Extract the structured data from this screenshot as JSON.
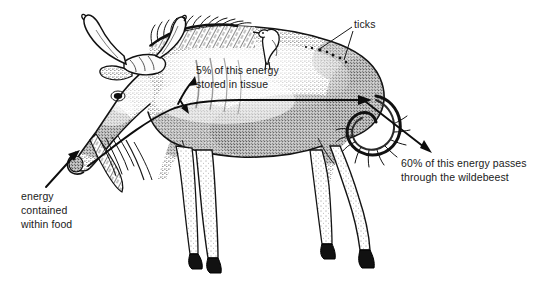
{
  "figure": {
    "subject": "wildebeest",
    "style": "stipple-ink-illustration",
    "background_color": "#ffffff",
    "ink_color": "#1a1a1a"
  },
  "annotations": {
    "energy_stored": {
      "id": "energy-stored-in-tissue",
      "lines": [
        "5% of this energy",
        "stored in tissue"
      ],
      "value": "5%"
    },
    "ticks": {
      "id": "ticks",
      "lines": [
        "ticks"
      ]
    },
    "energy_passes": {
      "id": "energy-passes-through",
      "lines": [
        "60% of this energy passes",
        "through the wildebeest"
      ],
      "value": "60%"
    },
    "energy_food": {
      "id": "energy-contained-within-food",
      "lines": [
        "energy",
        "contained",
        "within food"
      ]
    }
  },
  "arrows": [
    {
      "name": "food-intake-arrow",
      "from": "lower-left",
      "to": "mouth",
      "description": "points up-right into the wildebeest's mouth"
    },
    {
      "name": "energy-flow-arrow",
      "from": "mouth",
      "to": "rump",
      "description": "curves from mouth along body to hindquarters"
    },
    {
      "name": "tissue-storage-branch-arrow",
      "from": "neck",
      "to": "upper-body",
      "description": "short branch pointing up into the body tissue"
    },
    {
      "name": "energy-exit-arrow",
      "from": "tail",
      "to": "lower-right",
      "description": "passes through the curled tail pointing down-right"
    }
  ],
  "leader_lines": [
    {
      "name": "ticks-leader-upper",
      "from_label": "ticks",
      "to_feature": "rump-upper"
    },
    {
      "name": "ticks-leader-lower",
      "from_label": "ticks",
      "to_feature": "rump-lower"
    }
  ],
  "features": [
    {
      "name": "horns"
    },
    {
      "name": "mane"
    },
    {
      "name": "beard"
    },
    {
      "name": "oxpecker-bird"
    },
    {
      "name": "curled-tail"
    },
    {
      "name": "legs"
    },
    {
      "name": "hooves"
    }
  ]
}
